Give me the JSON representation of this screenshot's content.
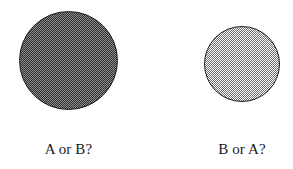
{
  "figure": {
    "background_color": "#ffffff",
    "width": 293,
    "height": 169
  },
  "stimuli": [
    {
      "id": "left",
      "shape_name": "filled-circle",
      "size_label": "large",
      "diameter_px": 99,
      "center_x": 68,
      "center_y": 60,
      "fill_style": "checkerboard-dither",
      "fill_tone": "dark",
      "fill_ink_color": "#2e2e2e",
      "fill_paper_color": "#8f8f8f",
      "outline_color": "#1b1b1b",
      "caption": "A or B?"
    },
    {
      "id": "right",
      "shape_name": "filled-circle",
      "size_label": "small",
      "diameter_px": 76,
      "center_x": 242,
      "center_y": 64,
      "fill_style": "checkerboard-dither",
      "fill_tone": "light",
      "fill_ink_color": "#6e6e6e",
      "fill_paper_color": "#ffffff",
      "outline_color": "#1b1b1b",
      "caption": "B or A?"
    }
  ]
}
